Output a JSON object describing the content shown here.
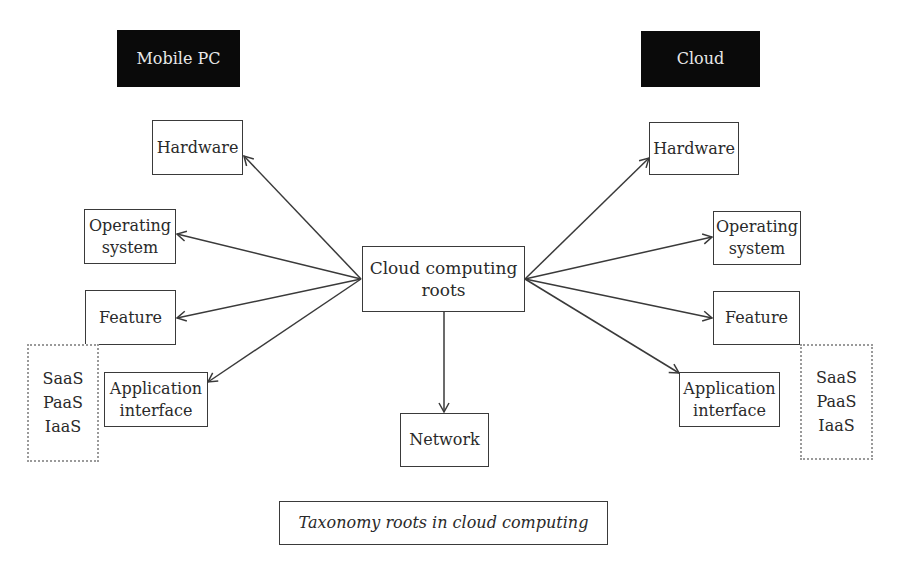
{
  "diagram": {
    "left_header": "Mobile PC",
    "right_header": "Cloud",
    "center": "Cloud computing\nroots",
    "bottom": "Network",
    "left_nodes": {
      "hardware": "Hardware",
      "os": "Operating\nsystem",
      "feature": "Feature",
      "app": "Application\ninterface"
    },
    "right_nodes": {
      "hardware": "Hardware",
      "os": "Operating\nsystem",
      "feature": "Feature",
      "app": "Application\ninterface"
    },
    "left_service_models": "SaaS\nPaaS\nIaaS",
    "right_service_models": "SaaS\nPaaS\nIaaS",
    "caption": "Taxonomy roots in cloud computing",
    "colors": {
      "header_bg": "#0a0a0a",
      "header_text": "#e8e8e8",
      "line": "#3a3a3a",
      "dotted_border": "#9a9a9a"
    }
  }
}
